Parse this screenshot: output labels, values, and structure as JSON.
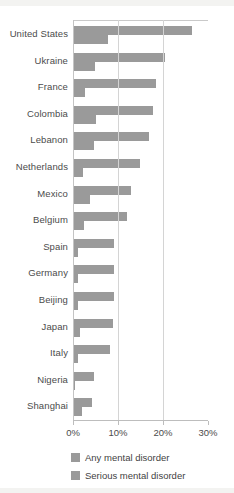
{
  "chart_data": {
    "type": "bar",
    "orientation": "horizontal",
    "title": "",
    "xlabel": "",
    "ylabel": "",
    "xlim": [
      0,
      30
    ],
    "xticks": [
      0,
      10,
      20,
      30
    ],
    "xtick_labels": [
      "0%",
      "10%",
      "20%",
      "30%"
    ],
    "grid": true,
    "legend_position": "bottom-left",
    "categories": [
      "United States",
      "Ukraine",
      "France",
      "Colombia",
      "Lebanon",
      "Netherlands",
      "Mexico",
      "Belgium",
      "Spain",
      "Germany",
      "Beijing",
      "Japan",
      "Italy",
      "Nigeria",
      "Shanghai"
    ],
    "series": [
      {
        "name": "Any mental disorder",
        "color": "#9a9a9a",
        "values": [
          26.4,
          20.5,
          18.4,
          17.8,
          16.9,
          14.9,
          12.8,
          12.0,
          9.2,
          9.1,
          9.1,
          8.8,
          8.2,
          4.7,
          4.3
        ]
      },
      {
        "name": "Serious mental disorder",
        "color": "#9a9a9a",
        "values": [
          7.7,
          4.8,
          2.7,
          5.2,
          4.6,
          2.3,
          3.7,
          2.4,
          1.0,
          1.2,
          1.1,
          1.5,
          1.0,
          0.4,
          1.9
        ]
      }
    ]
  },
  "legend": {
    "items": [
      {
        "label": "Any mental disorder",
        "color": "#9a9a9a"
      },
      {
        "label": "Serious mental disorder",
        "color": "#9a9a9a"
      }
    ]
  },
  "axis": {
    "tick_labels": [
      "0%",
      "10%",
      "20%",
      "30%"
    ]
  }
}
